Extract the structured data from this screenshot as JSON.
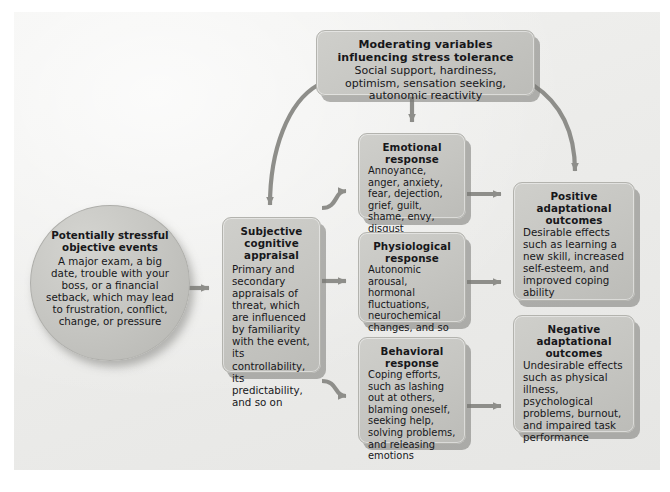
{
  "diagram": {
    "nodes": {
      "events": {
        "title": "Potentially\nstressful\nobjective events",
        "title_lines": [
          "Potentially",
          "stressful",
          "objective events"
        ],
        "body": "A major exam, a big date, trouble with your boss, or a financial setback, which may lead to frustration, conflict, change, or pressure",
        "shape": "ellipse"
      },
      "moderating": {
        "title": "Moderating variables influencing stress tolerance",
        "title_lines": [
          "Moderating variables influencing",
          "stress tolerance"
        ],
        "body": "Social support, hardiness, optimism, sensation seeking, autonomic reactivity",
        "shape": "rounded-rect"
      },
      "appraisal": {
        "title": "Subjective cognitive appraisal",
        "title_lines": [
          "Subjective",
          "cognitive",
          "appraisal"
        ],
        "body": "Primary and secondary appraisals of threat, which are influenced by familiarity with the event, its controllability, its predictability, and so on",
        "shape": "rounded-rect"
      },
      "emotional": {
        "title": "Emotional response",
        "title_lines": [
          "Emotional",
          "response"
        ],
        "body": "Annoyance, anger, anxiety, fear, dejection, grief, guilt, shame, envy, disgust",
        "shape": "rounded-rect"
      },
      "physiological": {
        "title": "Physiological response",
        "title_lines": [
          "Physiological",
          "response"
        ],
        "body": "Autonomic arousal, hormonal fluctuations, neurochemical changes, and so on",
        "shape": "rounded-rect"
      },
      "behavioral": {
        "title": "Behavioral response",
        "title_lines": [
          "Behavioral",
          "response"
        ],
        "body": "Coping efforts, such as lashing out at others, blaming oneself, seeking help, solving problems, and releasing emotions",
        "shape": "rounded-rect"
      },
      "positive": {
        "title": "Positive adaptational outcomes",
        "title_lines": [
          "Positive",
          "adaptational",
          "outcomes"
        ],
        "body": "Desirable effects such as learning a new skill, increased self-esteem, and improved coping ability",
        "shape": "rounded-rect"
      },
      "negative": {
        "title": "Negative adaptational outcomes",
        "title_lines": [
          "Negative",
          "adaptational",
          "outcomes"
        ],
        "body": "Undesirable effects such as physical illness, psychological problems, burnout, and impaired task performance",
        "shape": "rounded-rect"
      }
    },
    "edges": [
      {
        "from": "events",
        "to": "appraisal",
        "style": "straight-arrow"
      },
      {
        "from": "moderating",
        "to": "appraisal",
        "style": "curved-arrow"
      },
      {
        "from": "moderating",
        "to": "emotional",
        "style": "straight-arrow"
      },
      {
        "from": "moderating",
        "to": "positive",
        "style": "curved-arrow"
      },
      {
        "from": "appraisal",
        "to": "emotional",
        "style": "curved-arrow"
      },
      {
        "from": "appraisal",
        "to": "physiological",
        "style": "straight-arrow"
      },
      {
        "from": "appraisal",
        "to": "behavioral",
        "style": "curved-arrow"
      },
      {
        "from": "emotional",
        "to": "positive",
        "style": "straight-arrow"
      },
      {
        "from": "physiological",
        "to": "positive",
        "style": "straight-arrow"
      },
      {
        "from": "behavioral",
        "to": "negative",
        "style": "straight-arrow"
      }
    ],
    "colors": {
      "node_fill": "#c6c6c2",
      "node_border": "#b3b3ae",
      "panel_bg": "#ececea",
      "arrow": "#8e8e8a",
      "text": "#17171a",
      "page_bg": "#ffffff"
    }
  }
}
